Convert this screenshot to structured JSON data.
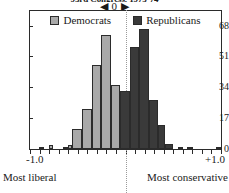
{
  "chart_data": {
    "type": "bar",
    "title": "93rd Congress, 1973-74",
    "subtitle": "",
    "xlabel": "",
    "ylabel": "",
    "xlim": [
      -1.0,
      1.0
    ],
    "ylim": [
      0,
      76
    ],
    "grid": false,
    "legend_position": "top-center",
    "y_ticks": [
      0,
      17,
      34,
      51,
      68
    ],
    "x_ticks": [
      -1.0,
      0,
      1.0
    ],
    "x_tick_labels": [
      "-1.0",
      "0",
      "+1.0"
    ],
    "x_axis_left_caption": "Most liberal",
    "x_axis_right_caption": "Most conservative",
    "zero_marker": "◀ 0 ▶",
    "bin_width": 0.05,
    "legend": [
      {
        "name": "Democrats",
        "color": "#a9a9a9"
      },
      {
        "name": "Republicans",
        "color": "#3a3a3a"
      }
    ],
    "bin_centers": [
      -0.975,
      -0.925,
      -0.875,
      -0.825,
      -0.775,
      -0.725,
      -0.675,
      -0.625,
      -0.575,
      -0.525,
      -0.475,
      -0.425,
      -0.375,
      -0.325,
      -0.275,
      -0.225,
      -0.175,
      -0.125,
      -0.075,
      -0.025,
      0.025,
      0.075,
      0.125,
      0.175,
      0.225,
      0.275,
      0.325,
      0.375,
      0.425,
      0.475,
      0.525,
      0.575,
      0.625,
      0.675,
      0.725,
      0.775,
      0.825,
      0.875,
      0.925,
      0.975
    ],
    "series": [
      {
        "name": "Democrats",
        "color": "#a9a9a9",
        "values": [
          0,
          0,
          1,
          0,
          2,
          0,
          0,
          1,
          2,
          11,
          11,
          22,
          22,
          46,
          46,
          63,
          63,
          35,
          35,
          29,
          29,
          19,
          19,
          11,
          11,
          4,
          4,
          0,
          0,
          0,
          0,
          0,
          0,
          0,
          0,
          0,
          0,
          0,
          0,
          0
        ]
      },
      {
        "name": "Republicans",
        "color": "#3a3a3a",
        "values": [
          0,
          0,
          0,
          0,
          0,
          0,
          0,
          0,
          0,
          0,
          0,
          0,
          0,
          0,
          0,
          0,
          0,
          32,
          32,
          32,
          32,
          56,
          56,
          66,
          66,
          66,
          66,
          27,
          27,
          13,
          13,
          3,
          3,
          1,
          1,
          1,
          1,
          0,
          0,
          1
        ]
      }
    ],
    "bars": [
      {
        "series": "Democrats",
        "x0": -0.905,
        "x1": -0.855,
        "value": 1
      },
      {
        "series": "Democrats",
        "x0": -0.805,
        "x1": -0.755,
        "value": 2
      },
      {
        "series": "Democrats",
        "x0": -0.655,
        "x1": -0.605,
        "value": 1
      },
      {
        "series": "Democrats",
        "x0": -0.605,
        "x1": -0.555,
        "value": 2
      },
      {
        "series": "Democrats",
        "x0": -0.555,
        "x1": -0.455,
        "value": 11
      },
      {
        "series": "Democrats",
        "x0": -0.455,
        "x1": -0.355,
        "value": 22
      },
      {
        "series": "Democrats",
        "x0": -0.355,
        "x1": -0.255,
        "value": 46
      },
      {
        "series": "Democrats",
        "x0": -0.255,
        "x1": -0.155,
        "value": 63
      },
      {
        "series": "Democrats",
        "x0": -0.155,
        "x1": -0.055,
        "value": 35
      },
      {
        "series": "Democrats",
        "x0": -0.055,
        "x1": 0.045,
        "value": 29
      },
      {
        "series": "Democrats",
        "x0": 0.045,
        "x1": 0.095,
        "value": 19
      },
      {
        "series": "Democrats",
        "x0": 0.095,
        "x1": 0.145,
        "value": 11
      },
      {
        "series": "Democrats",
        "x0": 0.145,
        "x1": 0.195,
        "value": 4
      },
      {
        "series": "Republicans",
        "x0": -0.055,
        "x1": 0.045,
        "value": 32
      },
      {
        "series": "Republicans",
        "x0": 0.045,
        "x1": 0.145,
        "value": 56
      },
      {
        "series": "Republicans",
        "x0": 0.145,
        "x1": 0.245,
        "value": 66
      },
      {
        "series": "Republicans",
        "x0": 0.245,
        "x1": 0.345,
        "value": 27
      },
      {
        "series": "Republicans",
        "x0": 0.345,
        "x1": 0.415,
        "value": 13
      },
      {
        "series": "Republicans",
        "x0": 0.415,
        "x1": 0.495,
        "value": 3
      },
      {
        "series": "Republicans",
        "x0": 0.545,
        "x1": 0.605,
        "value": 1
      },
      {
        "series": "Republicans",
        "x0": 0.645,
        "x1": 0.705,
        "value": 1
      },
      {
        "series": "Republicans",
        "x0": 0.945,
        "x1": 0.995,
        "value": 1
      }
    ]
  }
}
